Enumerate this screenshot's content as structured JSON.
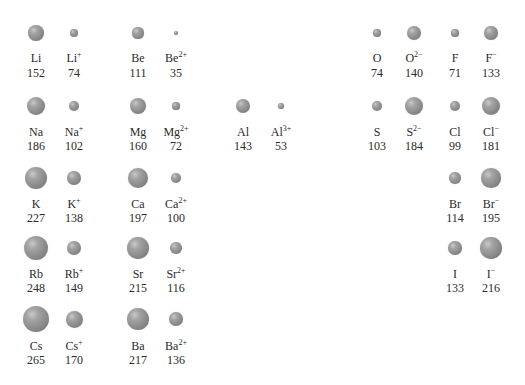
{
  "scale_px_per_pm": 0.05,
  "row_y": [
    33,
    106,
    178,
    248,
    319
  ],
  "label_y": [
    52,
    126,
    198,
    268,
    340
  ],
  "value_y": [
    67,
    140,
    212,
    282,
    354
  ],
  "col_x": [
    36,
    74,
    138,
    176,
    243,
    281,
    377,
    414,
    455,
    491
  ],
  "items": [
    {
      "sym": "Li",
      "charge": "",
      "radius": 152,
      "row": 0,
      "col": 0
    },
    {
      "sym": "Li",
      "charge": "+",
      "radius": 74,
      "row": 0,
      "col": 1
    },
    {
      "sym": "Be",
      "charge": "",
      "radius": 111,
      "row": 0,
      "col": 2
    },
    {
      "sym": "Be",
      "charge": "2+",
      "radius": 35,
      "row": 0,
      "col": 3
    },
    {
      "sym": "O",
      "charge": "",
      "radius": 74,
      "row": 0,
      "col": 6
    },
    {
      "sym": "O",
      "charge": "2−",
      "radius": 140,
      "row": 0,
      "col": 7
    },
    {
      "sym": "F",
      "charge": "",
      "radius": 71,
      "row": 0,
      "col": 8
    },
    {
      "sym": "F",
      "charge": "−",
      "radius": 133,
      "row": 0,
      "col": 9
    },
    {
      "sym": "Na",
      "charge": "",
      "radius": 186,
      "row": 1,
      "col": 0
    },
    {
      "sym": "Na",
      "charge": "+",
      "radius": 102,
      "row": 1,
      "col": 1
    },
    {
      "sym": "Mg",
      "charge": "",
      "radius": 160,
      "row": 1,
      "col": 2
    },
    {
      "sym": "Mg",
      "charge": "2+",
      "radius": 72,
      "row": 1,
      "col": 3
    },
    {
      "sym": "Al",
      "charge": "",
      "radius": 143,
      "row": 1,
      "col": 4
    },
    {
      "sym": "Al",
      "charge": "3+",
      "radius": 53,
      "row": 1,
      "col": 5
    },
    {
      "sym": "S",
      "charge": "",
      "radius": 103,
      "row": 1,
      "col": 6
    },
    {
      "sym": "S",
      "charge": "2−",
      "radius": 184,
      "row": 1,
      "col": 7
    },
    {
      "sym": "Cl",
      "charge": "",
      "radius": 99,
      "row": 1,
      "col": 8
    },
    {
      "sym": "Cl",
      "charge": "−",
      "radius": 181,
      "row": 1,
      "col": 9
    },
    {
      "sym": "K",
      "charge": "",
      "radius": 227,
      "row": 2,
      "col": 0
    },
    {
      "sym": "K",
      "charge": "+",
      "radius": 138,
      "row": 2,
      "col": 1
    },
    {
      "sym": "Ca",
      "charge": "",
      "radius": 197,
      "row": 2,
      "col": 2
    },
    {
      "sym": "Ca",
      "charge": "2+",
      "radius": 100,
      "row": 2,
      "col": 3
    },
    {
      "sym": "Br",
      "charge": "",
      "radius": 114,
      "row": 2,
      "col": 8
    },
    {
      "sym": "Br",
      "charge": "−",
      "radius": 195,
      "row": 2,
      "col": 9
    },
    {
      "sym": "Rb",
      "charge": "",
      "radius": 248,
      "row": 3,
      "col": 0
    },
    {
      "sym": "Rb",
      "charge": "+",
      "radius": 149,
      "row": 3,
      "col": 1
    },
    {
      "sym": "Sr",
      "charge": "",
      "radius": 215,
      "row": 3,
      "col": 2
    },
    {
      "sym": "Sr",
      "charge": "2+",
      "radius": 116,
      "row": 3,
      "col": 3
    },
    {
      "sym": "I",
      "charge": "",
      "radius": 133,
      "row": 3,
      "col": 8
    },
    {
      "sym": "I",
      "charge": "−",
      "radius": 216,
      "row": 3,
      "col": 9
    },
    {
      "sym": "Cs",
      "charge": "",
      "radius": 265,
      "row": 4,
      "col": 0
    },
    {
      "sym": "Cs",
      "charge": "+",
      "radius": 170,
      "row": 4,
      "col": 1
    },
    {
      "sym": "Ba",
      "charge": "",
      "radius": 217,
      "row": 4,
      "col": 2
    },
    {
      "sym": "Ba",
      "charge": "2+",
      "radius": 136,
      "row": 4,
      "col": 3
    }
  ]
}
